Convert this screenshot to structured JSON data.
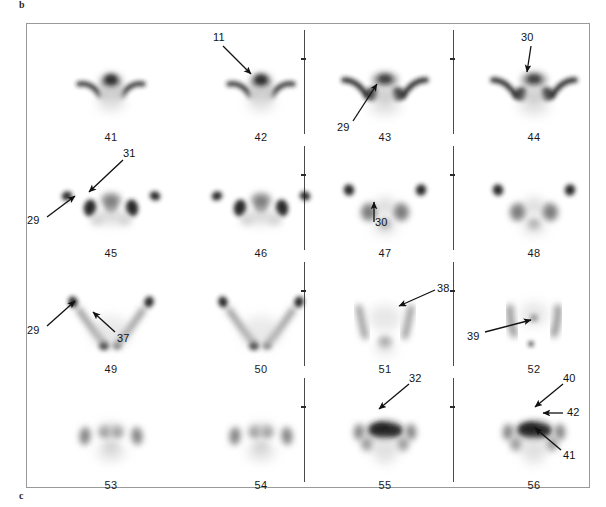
{
  "figure": {
    "panel_label_b": "b",
    "panel_label_c": "c",
    "frame": {
      "x": 26,
      "y": 23,
      "width": 564,
      "height": 465
    },
    "modality": "scintigraphy-slice-montage",
    "columns": 4,
    "rows": 4,
    "separators": [
      {
        "name": "column-separator-2",
        "x": 277,
        "segments": [
          {
            "y": 6,
            "height": 104,
            "tick_y": 34
          },
          {
            "y": 122,
            "height": 104,
            "tick_y": 150
          },
          {
            "y": 238,
            "height": 104,
            "tick_y": 266
          },
          {
            "y": 354,
            "height": 104,
            "tick_y": 382
          }
        ]
      },
      {
        "name": "column-separator-3",
        "x": 426,
        "segments": [
          {
            "y": 6,
            "height": 104,
            "tick_y": 34
          },
          {
            "y": 122,
            "height": 104,
            "tick_y": 150
          },
          {
            "y": 238,
            "height": 104,
            "tick_y": 266
          },
          {
            "y": 354,
            "height": 104,
            "tick_y": 382
          }
        ]
      }
    ],
    "slices": [
      {
        "number": "41",
        "cell_x": 14,
        "cell_y": 14,
        "pattern": "upper-high-crescents-center-blob"
      },
      {
        "number": "42",
        "cell_x": 164,
        "cell_y": 14,
        "pattern": "upper-high-crescents-center-blob"
      },
      {
        "number": "43",
        "cell_x": 288,
        "cell_y": 14,
        "pattern": "wide-crescents-center-cluster"
      },
      {
        "number": "44",
        "cell_x": 437,
        "cell_y": 14,
        "pattern": "wide-crescents-center-cluster"
      },
      {
        "number": "45",
        "cell_x": 14,
        "cell_y": 130,
        "pattern": "four-hotspots-row"
      },
      {
        "number": "46",
        "cell_x": 164,
        "cell_y": 130,
        "pattern": "four-hotspots-row"
      },
      {
        "number": "47",
        "cell_x": 288,
        "cell_y": 130,
        "pattern": "v-shape-two-poles"
      },
      {
        "number": "48",
        "cell_x": 437,
        "cell_y": 130,
        "pattern": "v-shape-two-poles"
      },
      {
        "number": "49",
        "cell_x": 14,
        "cell_y": 246,
        "pattern": "v-shape-faint-base"
      },
      {
        "number": "50",
        "cell_x": 164,
        "cell_y": 246,
        "pattern": "v-shape-faint-base"
      },
      {
        "number": "51",
        "cell_x": 288,
        "cell_y": 246,
        "pattern": "faint-lateral-bands"
      },
      {
        "number": "52",
        "cell_x": 437,
        "cell_y": 246,
        "pattern": "faint-lateral-bands-dot"
      },
      {
        "number": "53",
        "cell_x": 14,
        "cell_y": 362,
        "pattern": "mid-cluster-symmetric"
      },
      {
        "number": "54",
        "cell_x": 164,
        "cell_y": 362,
        "pattern": "mid-cluster-symmetric"
      },
      {
        "number": "55",
        "cell_x": 288,
        "cell_y": 362,
        "pattern": "dense-central-mass"
      },
      {
        "number": "56",
        "cell_x": 437,
        "cell_y": 362,
        "pattern": "dense-central-mass"
      }
    ],
    "annotations": [
      {
        "id": "a11",
        "label": "11",
        "slice": "42",
        "label_x": 186,
        "label_y": 7,
        "arrow": {
          "x1": 196,
          "y1": 22,
          "x2": 224,
          "y2": 50
        }
      },
      {
        "id": "a29a",
        "label": "29",
        "slice": "43",
        "label_x": 310,
        "label_y": 97,
        "arrow": {
          "x1": 326,
          "y1": 97,
          "x2": 350,
          "y2": 60
        }
      },
      {
        "id": "a30a",
        "label": "30",
        "slice": "44",
        "label_x": 494,
        "label_y": 7,
        "arrow": {
          "x1": 504,
          "y1": 22,
          "x2": 500,
          "y2": 48
        }
      },
      {
        "id": "a31",
        "label": "31",
        "slice": "45",
        "label_x": 96,
        "label_y": 123,
        "arrow": {
          "x1": 96,
          "y1": 136,
          "x2": 62,
          "y2": 168
        }
      },
      {
        "id": "a29b",
        "label": "29",
        "slice": "45",
        "label_x": 0,
        "label_y": 190,
        "arrow": {
          "x1": 20,
          "y1": 193,
          "x2": 48,
          "y2": 172
        }
      },
      {
        "id": "a30b",
        "label": "30",
        "slice": "47",
        "label_x": 348,
        "label_y": 192,
        "arrow": {
          "x1": 347,
          "y1": 198,
          "x2": 347,
          "y2": 178
        }
      },
      {
        "id": "a29c",
        "label": "29",
        "slice": "49",
        "label_x": 0,
        "label_y": 300,
        "arrow": {
          "x1": 20,
          "y1": 302,
          "x2": 48,
          "y2": 277
        }
      },
      {
        "id": "a37",
        "label": "37",
        "slice": "49",
        "label_x": 90,
        "label_y": 308,
        "arrow": {
          "x1": 88,
          "y1": 308,
          "x2": 66,
          "y2": 288
        }
      },
      {
        "id": "a38",
        "label": "38",
        "slice": "51",
        "label_x": 410,
        "label_y": 258,
        "arrow": {
          "x1": 408,
          "y1": 266,
          "x2": 372,
          "y2": 282
        }
      },
      {
        "id": "a39",
        "label": "39",
        "slice": "52",
        "label_x": 440,
        "label_y": 306,
        "arrow": {
          "x1": 458,
          "y1": 308,
          "x2": 504,
          "y2": 296
        }
      },
      {
        "id": "a32",
        "label": "32",
        "slice": "55",
        "label_x": 382,
        "label_y": 348,
        "arrow": {
          "x1": 382,
          "y1": 360,
          "x2": 352,
          "y2": 385
        }
      },
      {
        "id": "a40",
        "label": "40",
        "slice": "56",
        "label_x": 536,
        "label_y": 348,
        "arrow": {
          "x1": 536,
          "y1": 360,
          "x2": 508,
          "y2": 383
        }
      },
      {
        "id": "a42",
        "label": "42",
        "slice": "56",
        "label_x": 540,
        "label_y": 382,
        "arrow": {
          "x1": 536,
          "y1": 389,
          "x2": 516,
          "y2": 389
        }
      },
      {
        "id": "a41",
        "label": "41",
        "slice": "56",
        "label_x": 536,
        "label_y": 425,
        "arrow": {
          "x1": 534,
          "y1": 426,
          "x2": 508,
          "y2": 404
        }
      }
    ],
    "colors": {
      "frame_border": "#9a9a9a",
      "separator": "#4a4a4a",
      "text": "#111111",
      "activity_dark": "#1d1d1d",
      "activity_mid": "#6f6f6f",
      "activity_faint": "#c9c9c9",
      "background": "#ffffff"
    }
  }
}
